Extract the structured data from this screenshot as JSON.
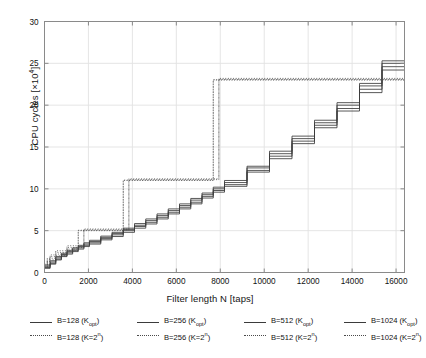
{
  "chart_data": {
    "type": "line",
    "title": "",
    "xlabel": "Filter length N [taps]",
    "ylabel": "CPU cycles [×10⁴]",
    "xlim": [
      0,
      16384
    ],
    "ylim": [
      0,
      30
    ],
    "xticks": [
      0,
      2000,
      4000,
      6000,
      8000,
      10000,
      12000,
      14000,
      16000
    ],
    "xticklabels": [
      "0",
      "2000",
      "4000",
      "6000",
      "8000",
      "10000",
      "12000",
      "14000",
      "16000"
    ],
    "yticks": [
      0,
      5,
      10,
      15,
      20,
      25,
      30
    ],
    "yticklabels": [
      "0",
      "5",
      "10",
      "15",
      "20",
      "25",
      "30"
    ],
    "grid": true,
    "legend_position": "below",
    "legend": [
      "B=128 (K_opt)",
      "B=256 (K_opt)",
      "B=512 (K_opt)",
      "B=1024 (K_opt)",
      "B=128 (K=2^n)",
      "B=256 (K=2^n)",
      "B=512 (K=2^n)",
      "B=1024 (K=2^n)"
    ],
    "series": [
      {
        "name": "B=128 (K_opt)",
        "style": "solid",
        "points": [
          [
            0,
            0.5
          ],
          [
            256,
            1.0
          ],
          [
            512,
            1.5
          ],
          [
            768,
            1.9
          ],
          [
            1024,
            2.2
          ],
          [
            1280,
            2.5
          ],
          [
            1536,
            2.8
          ],
          [
            1792,
            3.1
          ],
          [
            2048,
            3.4
          ],
          [
            2560,
            3.9
          ],
          [
            3072,
            4.3
          ],
          [
            3584,
            4.8
          ],
          [
            4096,
            5.3
          ],
          [
            4608,
            5.8
          ],
          [
            5120,
            6.4
          ],
          [
            5632,
            7.0
          ],
          [
            6144,
            7.6
          ],
          [
            6656,
            8.2
          ],
          [
            7168,
            8.9
          ],
          [
            7680,
            9.6
          ],
          [
            8192,
            10.3
          ],
          [
            9216,
            12.0
          ],
          [
            10240,
            13.6
          ],
          [
            11264,
            15.4
          ],
          [
            12288,
            17.3
          ],
          [
            13312,
            19.3
          ],
          [
            14336,
            21.5
          ],
          [
            15360,
            24.2
          ],
          [
            16384,
            27.0
          ]
        ]
      },
      {
        "name": "B=256 (K_opt)",
        "style": "solid",
        "points": [
          [
            0,
            0.6
          ],
          [
            256,
            1.1
          ],
          [
            512,
            1.6
          ],
          [
            768,
            2.0
          ],
          [
            1024,
            2.35
          ],
          [
            1280,
            2.65
          ],
          [
            1536,
            2.95
          ],
          [
            1792,
            3.25
          ],
          [
            2048,
            3.55
          ],
          [
            2560,
            4.05
          ],
          [
            3072,
            4.5
          ],
          [
            3584,
            5.0
          ],
          [
            4096,
            5.5
          ],
          [
            4608,
            6.0
          ],
          [
            5120,
            6.6
          ],
          [
            5632,
            7.2
          ],
          [
            6144,
            7.8
          ],
          [
            6656,
            8.4
          ],
          [
            7168,
            9.1
          ],
          [
            7680,
            9.8
          ],
          [
            8192,
            10.5
          ],
          [
            9216,
            12.2
          ],
          [
            10240,
            13.9
          ],
          [
            11264,
            15.7
          ],
          [
            12288,
            17.6
          ],
          [
            13312,
            19.6
          ],
          [
            14336,
            21.9
          ],
          [
            15360,
            24.6
          ],
          [
            16384,
            27.4
          ]
        ]
      },
      {
        "name": "B=512 (K_opt)",
        "style": "solid",
        "points": [
          [
            0,
            0.75
          ],
          [
            256,
            1.25
          ],
          [
            512,
            1.75
          ],
          [
            768,
            2.15
          ],
          [
            1024,
            2.5
          ],
          [
            1280,
            2.8
          ],
          [
            1536,
            3.1
          ],
          [
            1792,
            3.4
          ],
          [
            2048,
            3.7
          ],
          [
            2560,
            4.2
          ],
          [
            3072,
            4.65
          ],
          [
            3584,
            5.15
          ],
          [
            4096,
            5.65
          ],
          [
            4608,
            6.2
          ],
          [
            5120,
            6.8
          ],
          [
            5632,
            7.4
          ],
          [
            6144,
            8.0
          ],
          [
            6656,
            8.65
          ],
          [
            7168,
            9.3
          ],
          [
            7680,
            10.0
          ],
          [
            8192,
            10.75
          ],
          [
            9216,
            12.5
          ],
          [
            10240,
            14.2
          ],
          [
            11264,
            16.0
          ],
          [
            12288,
            17.9
          ],
          [
            13312,
            20.0
          ],
          [
            14336,
            22.3
          ],
          [
            15360,
            25.0
          ],
          [
            16384,
            27.6
          ]
        ]
      },
      {
        "name": "B=1024 (K_opt)",
        "style": "solid",
        "points": [
          [
            0,
            0.9
          ],
          [
            256,
            1.4
          ],
          [
            512,
            1.9
          ],
          [
            768,
            2.3
          ],
          [
            1024,
            2.65
          ],
          [
            1280,
            2.95
          ],
          [
            1536,
            3.25
          ],
          [
            1792,
            3.55
          ],
          [
            2048,
            3.85
          ],
          [
            2560,
            4.35
          ],
          [
            3072,
            4.8
          ],
          [
            3584,
            5.3
          ],
          [
            4096,
            5.85
          ],
          [
            4608,
            6.4
          ],
          [
            5120,
            7.0
          ],
          [
            5632,
            7.6
          ],
          [
            6144,
            8.2
          ],
          [
            6656,
            8.85
          ],
          [
            7168,
            9.5
          ],
          [
            7680,
            10.2
          ],
          [
            8192,
            11.0
          ],
          [
            9216,
            12.7
          ],
          [
            10240,
            14.5
          ],
          [
            11264,
            16.3
          ],
          [
            12288,
            18.2
          ],
          [
            13312,
            20.3
          ],
          [
            14336,
            22.6
          ],
          [
            15360,
            25.3
          ],
          [
            16384,
            27.9
          ]
        ]
      },
      {
        "name": "B=128 (K=2^n)",
        "style": "dotted",
        "points": [
          [
            0,
            0.6
          ],
          [
            128,
            1.3
          ],
          [
            256,
            1.5
          ],
          [
            512,
            2.0
          ],
          [
            1024,
            2.6
          ],
          [
            1536,
            5.0
          ],
          [
            3072,
            5.0
          ],
          [
            3584,
            11.0
          ],
          [
            7168,
            11.0
          ],
          [
            7680,
            23.0
          ],
          [
            16384,
            23.0
          ]
        ]
      },
      {
        "name": "B=256 (K=2^n)",
        "style": "dotted",
        "points": [
          [
            0,
            0.7
          ],
          [
            128,
            1.4
          ],
          [
            256,
            1.7
          ],
          [
            512,
            2.2
          ],
          [
            1024,
            2.8
          ],
          [
            1536,
            5.05
          ],
          [
            3072,
            5.05
          ],
          [
            3584,
            11.05
          ],
          [
            7168,
            11.05
          ],
          [
            7680,
            23.05
          ],
          [
            16384,
            23.05
          ]
        ]
      },
      {
        "name": "B=512 (K=2^n)",
        "style": "dotted",
        "points": [
          [
            0,
            0.85
          ],
          [
            128,
            1.55
          ],
          [
            256,
            1.9
          ],
          [
            512,
            2.4
          ],
          [
            1024,
            3.0
          ],
          [
            1792,
            5.1
          ],
          [
            3328,
            5.1
          ],
          [
            3840,
            11.1
          ],
          [
            7424,
            11.1
          ],
          [
            7936,
            23.1
          ],
          [
            16384,
            23.1
          ]
        ]
      },
      {
        "name": "B=1024 (K=2^n)",
        "style": "dotted",
        "points": [
          [
            0,
            1.0
          ],
          [
            128,
            1.7
          ],
          [
            256,
            2.1
          ],
          [
            512,
            2.6
          ],
          [
            1024,
            3.2
          ],
          [
            1792,
            5.2
          ],
          [
            3328,
            5.2
          ],
          [
            3840,
            11.2
          ],
          [
            7424,
            11.2
          ],
          [
            7936,
            23.2
          ],
          [
            16384,
            23.2
          ]
        ]
      }
    ]
  },
  "legend_entries": [
    {
      "label_prefix": "B=128 (K",
      "sub": "opt",
      "suffix": ")",
      "style": "solid"
    },
    {
      "label_prefix": "B=128 (K=2",
      "sup": "n",
      "suffix": ")",
      "style": "dotted"
    },
    {
      "label_prefix": "B=256 (K",
      "sub": "opt",
      "suffix": ")",
      "style": "solid"
    },
    {
      "label_prefix": "B=256 (K=2",
      "sup": "n",
      "suffix": ")",
      "style": "dotted"
    },
    {
      "label_prefix": "B=512 (K",
      "sub": "opt",
      "suffix": ")",
      "style": "solid"
    },
    {
      "label_prefix": "B=512 (K=2",
      "sup": "n",
      "suffix": ")",
      "style": "dotted"
    },
    {
      "label_prefix": "B=1024 (K",
      "sub": "opt",
      "suffix": ")",
      "style": "solid"
    },
    {
      "label_prefix": "B=1024 (K=2",
      "sup": "n",
      "suffix": ")",
      "style": "dotted"
    }
  ],
  "colors": {
    "solid_line": "#3b3b3b",
    "dotted_line": "#4a4a4a",
    "grid": "#e2e2e2",
    "frame": "#8a8a8a",
    "text": "#111111"
  }
}
